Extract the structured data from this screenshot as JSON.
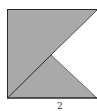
{
  "figure": {
    "caption": "2",
    "fill_color": "#a9a9a9",
    "stroke_color": "#2a2a2a",
    "notch_color": "#ffffff",
    "square": {
      "x1": 7,
      "y1": 9,
      "x2": 97,
      "y2": 98
    },
    "notch_vertex": {
      "x": 51,
      "y": 55
    }
  }
}
